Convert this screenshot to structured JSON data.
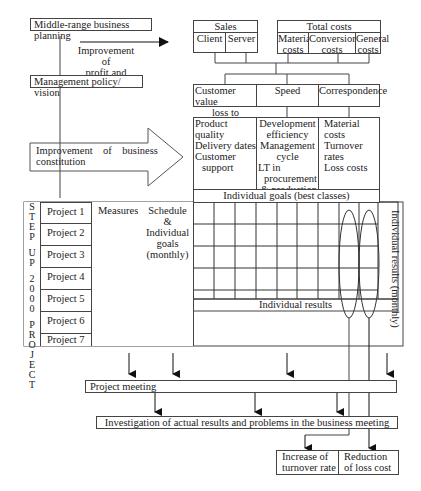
{
  "top_left": {
    "planning_box": "Middle-range business planning",
    "arrow_label_line1": "Improvement of",
    "arrow_label_line2": "profit and loss",
    "policy_box": "Management policy/ vision",
    "big_arrow_line1": "Improvement    of    business",
    "big_arrow_line2": "constitution"
  },
  "top_right": {
    "sales": {
      "title": "Sales",
      "items": [
        "Client",
        "Server"
      ]
    },
    "total_costs": {
      "title": "Total costs",
      "items": [
        "Material costs",
        "Conversion costs",
        "General costs"
      ],
      "items_split": [
        [
          "Material",
          "costs"
        ],
        [
          "Conversion",
          "costs"
        ],
        [
          "General",
          "costs"
        ]
      ]
    },
    "factors": [
      "Customer value loss to changes",
      "Speed",
      "Correspondence"
    ],
    "factors_split": {
      "customer_line1": "Customer value",
      "customer_line2": "loss to changes"
    },
    "details": {
      "col1": [
        "Product quality",
        "Delivery dates",
        "Customer",
        "support"
      ],
      "col2": [
        "Development",
        "efficiency",
        "Management",
        "cycle",
        "LT in",
        "procurement",
        "& production"
      ],
      "col3": [
        "Material costs",
        "Turnover rates",
        "Loss costs"
      ]
    },
    "goals_header": "Individual goals (best classes)"
  },
  "matrix": {
    "vertical_label_chars": [
      "S",
      "T",
      "E",
      "P",
      "U",
      "P",
      "2",
      "0",
      "0",
      "0",
      "P",
      "R",
      "O",
      "J",
      "E",
      "C",
      "T"
    ],
    "vertical_label": "STEP UP 2000 PROJECT",
    "projects": [
      "Project 1",
      "Project 2",
      "Project 3",
      "Project 4",
      "Project 5",
      "Project 6",
      "Project 7"
    ],
    "measures_header": "Measures",
    "schedule_header_lines": [
      "Schedule",
      "&",
      "Individual",
      "goals",
      "(monthly)"
    ],
    "right_label": "Individual results (monthly)",
    "results_footer": "Individual results",
    "grid_columns": 9,
    "grid_rows": 6
  },
  "bottom": {
    "project_meeting": "Project meeting",
    "investigation": "Investigation of actual results and problems in the business meeting",
    "outcome_1_line1": "Increase of",
    "outcome_1_line2": "turnover rate",
    "outcome_2_line1": "Reduction",
    "outcome_2_line2": "of loss cost"
  }
}
